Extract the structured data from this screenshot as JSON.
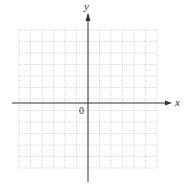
{
  "diagram": {
    "type": "coordinate-plane",
    "x_axis_label": "x",
    "y_axis_label": "y",
    "origin_label": "0",
    "grid": {
      "columns": 12,
      "rows": 12,
      "style": "dotted",
      "left": 19,
      "top": 30,
      "cell": 11.5
    },
    "axes": {
      "origin_x": 88,
      "origin_y": 103,
      "x_start": 12,
      "x_end": 172,
      "y_start": 10,
      "y_end": 182
    },
    "colors": {
      "grid": "#b0b0b0",
      "axis": "#333333",
      "background": "#ffffff"
    }
  }
}
